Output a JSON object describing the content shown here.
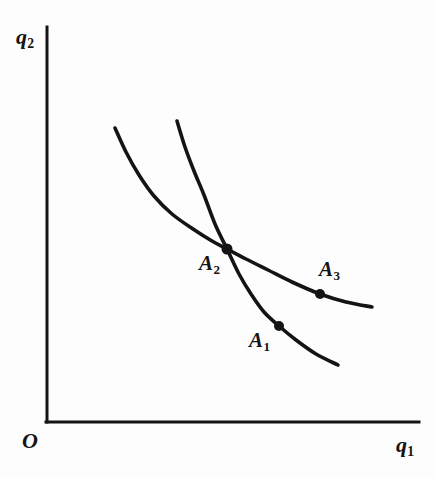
{
  "figure": {
    "width": 436,
    "height": 478,
    "background_color": "#fdfdfd",
    "ink_color": "#141414"
  },
  "axes": {
    "origin_label": "O",
    "y_axis_label_base": "q",
    "y_axis_label_sub": "2",
    "x_axis_label_base": "q",
    "x_axis_label_sub": "1",
    "x_axis_line": {
      "x1": 47,
      "y1": 422,
      "x2": 419,
      "y2": 422
    },
    "y_axis_line": {
      "x1": 47,
      "y1": 27,
      "x2": 47,
      "y2": 422
    },
    "line_width": 3,
    "ticks": [],
    "grid": false
  },
  "points": [
    {
      "id": "A1",
      "label_base": "A",
      "label_sub": "1",
      "x": 279,
      "y": 326,
      "radius": 5,
      "on_curve": "curve-2"
    },
    {
      "id": "A2",
      "label_base": "A",
      "label_sub": "2",
      "x": 227,
      "y": 249,
      "radius": 5.5,
      "on_curve": "intersection"
    },
    {
      "id": "A3",
      "label_base": "A",
      "label_sub": "3",
      "x": 320,
      "y": 294,
      "radius": 5,
      "on_curve": "curve-1"
    }
  ],
  "chart_data": {
    "type": "line",
    "title": "",
    "xlabel": "q1",
    "ylabel": "q2",
    "xlim": [
      47,
      419
    ],
    "ylim": [
      27,
      422
    ],
    "grid": false,
    "legend": "none",
    "annotations": [
      "O",
      "q1",
      "q2",
      "A1",
      "A2",
      "A3"
    ],
    "series": [
      {
        "name": "curve-1",
        "description": "flatter convex indifference curve through A2 and A3",
        "stroke_width": 3.6,
        "points": [
          [
            115,
            128
          ],
          [
            126,
            152
          ],
          [
            139,
            175
          ],
          [
            154,
            196
          ],
          [
            172,
            214
          ],
          [
            193,
            229
          ],
          [
            212,
            241
          ],
          [
            227,
            249
          ],
          [
            246,
            259
          ],
          [
            268,
            270
          ],
          [
            292,
            282
          ],
          [
            320,
            294
          ],
          [
            346,
            302
          ],
          [
            372,
            307
          ]
        ]
      },
      {
        "name": "curve-2",
        "description": "steeper convex indifference curve through A2 and A1",
        "stroke_width": 3.6,
        "points": [
          [
            177,
            121
          ],
          [
            185,
            147
          ],
          [
            194,
            171
          ],
          [
            204,
            195
          ],
          [
            215,
            224
          ],
          [
            227,
            249
          ],
          [
            239,
            274
          ],
          [
            251,
            294
          ],
          [
            264,
            312
          ],
          [
            279,
            326
          ],
          [
            296,
            340
          ],
          [
            316,
            354
          ],
          [
            338,
            365
          ]
        ]
      }
    ]
  }
}
